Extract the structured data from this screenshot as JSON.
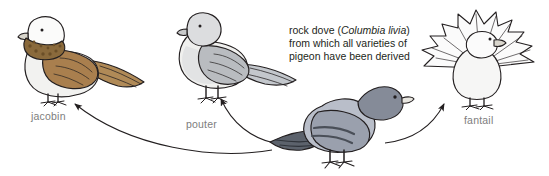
{
  "figure": {
    "background": "#ffffff",
    "caption": {
      "line1_pre": "rock dove (",
      "line1_sci": "Columbia livia",
      "line1_post": ")",
      "line2": "from which all varieties of",
      "line3": "pigeon have been derived",
      "color": "#231f20"
    },
    "label_color": "#7d7d7d",
    "breeds": [
      {
        "id": "jacobin",
        "label": "jacobin",
        "body_color": "#f2f2f0",
        "wing_color": "#a97f4e",
        "ruff_color": "#8a6a3c",
        "outline": "#231f20"
      },
      {
        "id": "pouter",
        "label": "pouter",
        "body_color": "#f0f0ee",
        "wing_color": "#b9bcc0",
        "shade_color": "#d5d7da",
        "outline": "#231f20"
      },
      {
        "id": "rock-dove",
        "label": "",
        "body_color": "#b9bec9",
        "wing_color": "#9aa0ad",
        "bar_color": "#4a4f58",
        "head_color": "#858b98",
        "outline": "#231f20"
      },
      {
        "id": "fantail",
        "label": "fantail",
        "body_color": "#f6f6f5",
        "tail_color": "#fbfbfb",
        "outline": "#231f20"
      }
    ],
    "arrows": [
      {
        "id": "arrow-to-jacobin",
        "from": "rock-dove",
        "to": "jacobin"
      },
      {
        "id": "arrow-to-pouter",
        "from": "rock-dove",
        "to": "pouter"
      },
      {
        "id": "arrow-to-fantail",
        "from": "rock-dove",
        "to": "fantail"
      }
    ]
  }
}
